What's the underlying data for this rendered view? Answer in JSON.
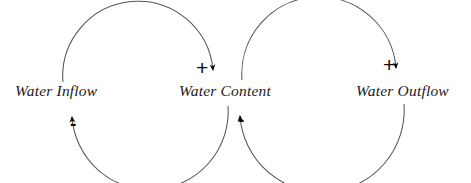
{
  "diagram": {
    "type": "causal-loop-diagram",
    "background_color": "#ffffff",
    "arc_color": "#555555",
    "arrow_color": "#0c0c0c",
    "text_color": "#1b1b1b",
    "nodes": [
      {
        "id": "water-inflow",
        "label": "Water Inflow",
        "x": 58,
        "y": 92
      },
      {
        "id": "water-content",
        "label": "Water Content",
        "x": 230,
        "y": 92
      },
      {
        "id": "water-outflow",
        "label": "Water Outflow",
        "x": 398,
        "y": 92
      }
    ],
    "links": [
      {
        "id": "inflow-to-content",
        "from": "water-inflow",
        "to": "water-content",
        "polarity": "+",
        "arc": "upper-clockwise"
      },
      {
        "id": "content-to-inflow",
        "from": "water-content",
        "to": "water-inflow",
        "polarity": "-",
        "arc": "lower-clockwise"
      },
      {
        "id": "content-to-outflow",
        "from": "water-content",
        "to": "water-outflow",
        "polarity": "+",
        "arc": "upper-clockwise"
      },
      {
        "id": "outflow-to-content",
        "from": "water-outflow",
        "to": "water-content",
        "polarity": "-",
        "arc": "lower-clockwise"
      }
    ],
    "polarity_marks": [
      {
        "id": "inflow-minus",
        "symbol": "-",
        "link": "content-to-inflow"
      },
      {
        "id": "content-plus",
        "symbol": "+",
        "link": "inflow-to-content"
      },
      {
        "id": "content-minus",
        "symbol": "-",
        "link": "outflow-to-content"
      },
      {
        "id": "outflow-plus",
        "symbol": "+",
        "link": "content-to-outflow"
      }
    ]
  }
}
